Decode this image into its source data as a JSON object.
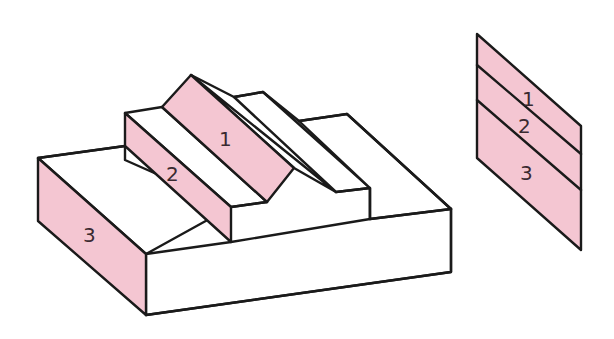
{
  "figure": {
    "colors": {
      "highlight": "#f4c6d2",
      "outline": "#1a1a1a",
      "background": "#ffffff",
      "label": "#3a2a30"
    },
    "block": {
      "face_labels": {
        "ridge_face": "1",
        "middle_step_face": "2",
        "front_step_face": "3"
      }
    },
    "developed_view": {
      "strip_labels": [
        "1",
        "2",
        "3"
      ]
    }
  }
}
